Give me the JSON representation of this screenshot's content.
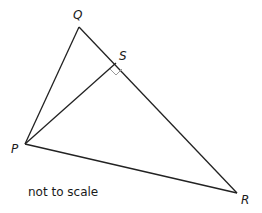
{
  "diagram": {
    "type": "geometry-triangle",
    "vertices": {
      "Q": {
        "label": "Q",
        "x": 79,
        "y": 27
      },
      "S": {
        "label": "S",
        "x": 116,
        "y": 63
      },
      "P": {
        "label": "P",
        "x": 25,
        "y": 144
      },
      "R": {
        "label": "R",
        "x": 237,
        "y": 193
      }
    },
    "segments": [
      "PQ",
      "QR",
      "PR",
      "PS"
    ],
    "right_angle_at": "S",
    "note": "not to scale",
    "colors": {
      "line": "#222222",
      "right_angle_mark": "#999999"
    }
  }
}
